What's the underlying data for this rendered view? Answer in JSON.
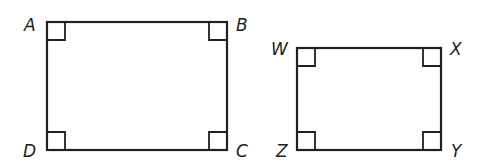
{
  "figure": {
    "rectangles": [
      {
        "name": "ABCD",
        "vertices": {
          "top_left": "A",
          "top_right": "B",
          "bottom_right": "C",
          "bottom_left": "D"
        },
        "right_angle_marks": 4
      },
      {
        "name": "WXYZ",
        "vertices": {
          "top_left": "W",
          "top_right": "X",
          "bottom_right": "Y",
          "bottom_left": "Z"
        },
        "right_angle_marks": 4
      }
    ]
  },
  "labels": {
    "A": "A",
    "B": "B",
    "C": "C",
    "D": "D",
    "W": "W",
    "X": "X",
    "Y": "Y",
    "Z": "Z"
  },
  "colors": {
    "stroke": "#231f20",
    "background": "#ffffff"
  }
}
